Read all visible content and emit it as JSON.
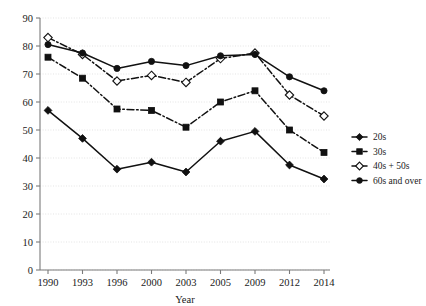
{
  "chart_data": {
    "type": "line",
    "title": "",
    "xlabel": "Year",
    "ylabel": "",
    "categories": [
      "1990",
      "1993",
      "1996",
      "2000",
      "2003",
      "2005",
      "2009",
      "2012",
      "2014"
    ],
    "ylim": [
      0,
      90
    ],
    "ytick_step": 10,
    "yticks": [
      "0",
      "10",
      "20",
      "30",
      "40",
      "50",
      "60",
      "70",
      "80",
      "90"
    ],
    "grid": true,
    "legend_position": "right",
    "series": [
      {
        "name": "20s",
        "marker": "filled-diamond",
        "linestyle": "solid",
        "values": [
          57,
          47,
          36,
          38.5,
          35,
          46,
          49.5,
          37.5,
          32.5
        ]
      },
      {
        "name": "30s",
        "marker": "filled-square",
        "linestyle": "dash-dot",
        "values": [
          76,
          68.5,
          57.5,
          57,
          51,
          60,
          64,
          50,
          42
        ]
      },
      {
        "name": "40s + 50s",
        "marker": "open-diamond",
        "linestyle": "dash-dot",
        "values": [
          83,
          77,
          67.5,
          69.5,
          67,
          75.5,
          77.5,
          62.5,
          55
        ]
      },
      {
        "name": "60s and over",
        "marker": "filled-circle",
        "linestyle": "solid",
        "values": [
          80.5,
          77.5,
          72,
          74.5,
          73,
          76.5,
          77,
          69,
          64
        ]
      }
    ]
  },
  "legend": {
    "items": [
      {
        "label": "20s"
      },
      {
        "label": "30s"
      },
      {
        "label": "40s + 50s"
      },
      {
        "label": "60s and over"
      }
    ]
  },
  "colors": {
    "ink": "#111111",
    "grid": "#d8d8d8",
    "axis": "#7a7a7a",
    "background": "#ffffff"
  }
}
